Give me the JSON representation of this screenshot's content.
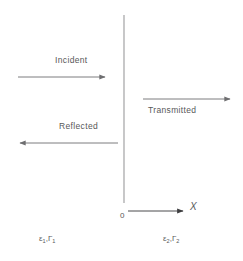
{
  "figure": {
    "colors": {
      "background": "#ffffff",
      "line": "#6e6e70",
      "text": "#58585a"
    },
    "interface": {
      "name": "boundary-line",
      "x": 124,
      "y_top": 15,
      "y_bottom": 203
    },
    "arrows": [
      {
        "id": "incident",
        "label": "Incident",
        "direction": "right",
        "x_start": 18,
        "x_end": 107,
        "y": 77,
        "label_position": "above"
      },
      {
        "id": "transmitted",
        "label": "Transmitted",
        "direction": "right",
        "x_start": 143,
        "x_end": 232,
        "y": 99,
        "label_position": "below"
      },
      {
        "id": "reflected",
        "label": "Reflected",
        "direction": "left",
        "x_start": 118,
        "x_end": 18,
        "y": 143,
        "label_position": "above"
      }
    ],
    "axis": {
      "name": "x-axis",
      "label": "X",
      "origin_label": "0",
      "x_start": 128,
      "x_end": 185,
      "y": 211
    },
    "media": [
      {
        "id": "medium-1",
        "side": "left",
        "permittivity": "ε",
        "permittivity_subscript": "1",
        "reflection": "Γ",
        "reflection_subscript": "1",
        "separator": ","
      },
      {
        "id": "medium-2",
        "side": "right",
        "permittivity": "ε",
        "permittivity_subscript": "2",
        "reflection": "Γ",
        "reflection_subscript": "2",
        "separator": ","
      }
    ]
  }
}
